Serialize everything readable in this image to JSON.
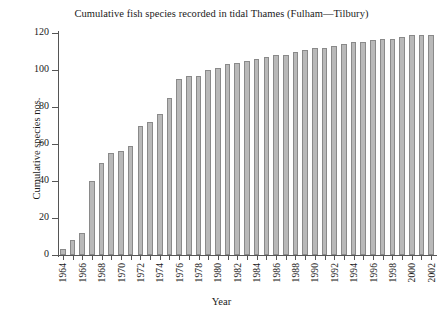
{
  "chart_data": {
    "type": "bar",
    "title": "Cumulative fish species recorded in tidal Thames (Fulham—Tilbury)",
    "xlabel": "Year",
    "ylabel": "Cumulative species nos.",
    "ylim": [
      0,
      120
    ],
    "yticks": [
      0,
      20,
      40,
      60,
      80,
      100,
      120
    ],
    "xlim": [
      1964,
      2002
    ],
    "xtick_labels": [
      "1964",
      "1966",
      "1968",
      "1970",
      "1972",
      "1974",
      "1976",
      "1978",
      "1980",
      "1982",
      "1984",
      "1986",
      "1988",
      "1990",
      "1992",
      "1994",
      "1996",
      "1998",
      "2000",
      "2002"
    ],
    "grid": false,
    "legend": null,
    "bar_color": "#b9b9b9",
    "bar_edge_color": "#8a8a8a",
    "categories": [
      1964,
      1965,
      1966,
      1967,
      1968,
      1969,
      1970,
      1971,
      1972,
      1973,
      1974,
      1975,
      1976,
      1977,
      1978,
      1979,
      1980,
      1981,
      1982,
      1983,
      1984,
      1985,
      1986,
      1987,
      1988,
      1989,
      1990,
      1991,
      1992,
      1993,
      1994,
      1995,
      1996,
      1997,
      1998,
      1999,
      2000,
      2001,
      2002
    ],
    "values": [
      3,
      8,
      12,
      40,
      50,
      55,
      56,
      59,
      70,
      72,
      76,
      85,
      95,
      97,
      97,
      100,
      101,
      103,
      104,
      105,
      106,
      107,
      108,
      108,
      110,
      111,
      112,
      112,
      113,
      114,
      115,
      115,
      116,
      117,
      117,
      118,
      119,
      119,
      119
    ]
  }
}
